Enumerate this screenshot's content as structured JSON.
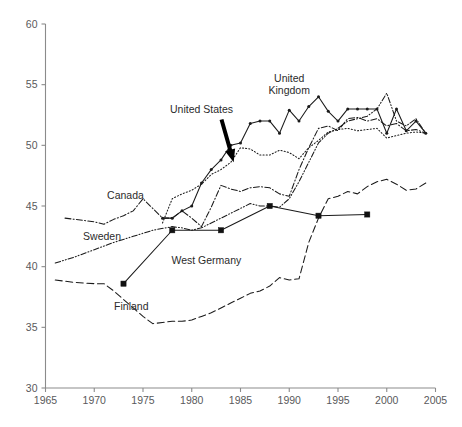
{
  "chart_data": {
    "type": "line",
    "title": "",
    "subtitle": "",
    "xlabel": "",
    "ylabel": "",
    "xlim": [
      1965,
      2005
    ],
    "ylim": [
      30,
      60
    ],
    "xticks": [
      1965,
      1970,
      1975,
      1980,
      1985,
      1990,
      1995,
      2000,
      2005
    ],
    "yticks": [
      30,
      35,
      40,
      45,
      50,
      55,
      60
    ],
    "grid": false,
    "legend_position": "inline-annotations",
    "annotations": [
      {
        "name": "united-states-callout",
        "text": "United States",
        "x": 1981.0,
        "y": 52.7,
        "arrow_to_x": 1984.3,
        "arrow_to_y": 48.6
      },
      {
        "name": "united-kingdom-label",
        "text_line1": "United",
        "text_line2": "Kingdom",
        "x": 1990.0,
        "y": 55.2
      },
      {
        "name": "canada-label",
        "text": "Canada",
        "x": 1973.2,
        "y": 45.6
      },
      {
        "name": "sweden-label",
        "text": "Sweden",
        "x": 1970.8,
        "y": 42.2
      },
      {
        "name": "west-germany-label",
        "text": "West Germany",
        "x": 1981.5,
        "y": 40.2
      },
      {
        "name": "finland-label",
        "text": "Finland",
        "x": 1973.8,
        "y": 36.4
      }
    ],
    "series": [
      {
        "name": "United Kingdom",
        "style": "solid",
        "marker": "dot",
        "color": "#1a1a1a",
        "points": [
          [
            1977,
            44.0
          ],
          [
            1978,
            44.0
          ],
          [
            1979,
            44.6
          ],
          [
            1980,
            45.0
          ],
          [
            1981,
            46.9
          ],
          [
            1982,
            48.0
          ],
          [
            1983,
            48.8
          ],
          [
            1984,
            50.0
          ],
          [
            1985,
            50.2
          ],
          [
            1986,
            51.8
          ],
          [
            1987,
            52.0
          ],
          [
            1988,
            52.0
          ],
          [
            1989,
            51.0
          ],
          [
            1990,
            52.9
          ],
          [
            1991,
            52.0
          ],
          [
            1992,
            53.2
          ],
          [
            1993,
            54.0
          ],
          [
            1994,
            52.8
          ],
          [
            1995,
            52.0
          ],
          [
            1996,
            53.0
          ],
          [
            1997,
            53.0
          ],
          [
            1998,
            53.0
          ],
          [
            1999,
            53.0
          ],
          [
            2000,
            51.0
          ],
          [
            2001,
            53.0
          ],
          [
            2002,
            51.2
          ],
          [
            2003,
            52.0
          ],
          [
            2004,
            51.0
          ]
        ]
      },
      {
        "name": "United States",
        "style": "dotted",
        "marker": "none",
        "color": "#1a1a1a",
        "points": [
          [
            1977,
            43.6
          ],
          [
            1978,
            45.6
          ],
          [
            1979,
            46.0
          ],
          [
            1980,
            46.3
          ],
          [
            1981,
            46.8
          ],
          [
            1982,
            47.6
          ],
          [
            1983,
            48.0
          ],
          [
            1984,
            48.6
          ],
          [
            1985,
            49.8
          ],
          [
            1986,
            49.7
          ],
          [
            1987,
            49.2
          ],
          [
            1988,
            49.2
          ],
          [
            1989,
            49.6
          ],
          [
            1990,
            49.4
          ],
          [
            1991,
            48.9
          ],
          [
            1992,
            49.8
          ],
          [
            1993,
            50.4
          ],
          [
            1994,
            51.1
          ],
          [
            1995,
            51.3
          ],
          [
            1996,
            51.4
          ],
          [
            1997,
            51.2
          ],
          [
            1998,
            51.3
          ],
          [
            1999,
            51.4
          ],
          [
            2000,
            50.6
          ],
          [
            2001,
            50.8
          ],
          [
            2002,
            51.0
          ],
          [
            2003,
            51.1
          ],
          [
            2004,
            51.0
          ]
        ]
      },
      {
        "name": "Canada",
        "style": "dash-dot",
        "marker": "none",
        "color": "#1a1a1a",
        "points": [
          [
            1967,
            44.0
          ],
          [
            1968,
            43.9
          ],
          [
            1969,
            43.8
          ],
          [
            1970,
            43.7
          ],
          [
            1971,
            43.5
          ],
          [
            1972,
            43.9
          ],
          [
            1973,
            44.2
          ],
          [
            1974,
            44.6
          ],
          [
            1975,
            45.6
          ],
          [
            1976,
            44.8
          ],
          [
            1977,
            44.0
          ],
          [
            1978,
            44.0
          ],
          [
            1979,
            44.6
          ],
          [
            1980,
            44.0
          ],
          [
            1981,
            43.3
          ],
          [
            1982,
            44.9
          ],
          [
            1983,
            46.7
          ],
          [
            1984,
            46.4
          ],
          [
            1985,
            46.2
          ],
          [
            1986,
            46.5
          ],
          [
            1987,
            46.6
          ],
          [
            1988,
            46.5
          ],
          [
            1989,
            46.0
          ],
          [
            1990,
            45.8
          ],
          [
            1991,
            48.0
          ],
          [
            1992,
            49.8
          ],
          [
            1993,
            51.4
          ],
          [
            1994,
            51.6
          ],
          [
            1995,
            51.2
          ],
          [
            1996,
            52.2
          ],
          [
            1997,
            52.3
          ],
          [
            1998,
            52.0
          ],
          [
            1999,
            52.2
          ],
          [
            2000,
            51.6
          ],
          [
            2001,
            51.8
          ],
          [
            2002,
            51.2
          ],
          [
            2003,
            51.3
          ],
          [
            2004,
            51.0
          ]
        ]
      },
      {
        "name": "Sweden",
        "style": "dash-dot-dot",
        "marker": "none",
        "color": "#1a1a1a",
        "points": [
          [
            1966,
            40.3
          ],
          [
            1968,
            40.8
          ],
          [
            1970,
            41.4
          ],
          [
            1972,
            42.0
          ],
          [
            1974,
            42.5
          ],
          [
            1976,
            43.0
          ],
          [
            1978,
            43.3
          ],
          [
            1979,
            43.2
          ],
          [
            1980,
            43.0
          ],
          [
            1981,
            43.2
          ],
          [
            1982,
            43.6
          ],
          [
            1983,
            44.0
          ],
          [
            1984,
            44.4
          ],
          [
            1985,
            44.8
          ],
          [
            1986,
            45.2
          ],
          [
            1987,
            45.0
          ],
          [
            1988,
            45.0
          ],
          [
            1989,
            44.9
          ],
          [
            1990,
            45.6
          ],
          [
            1991,
            47.0
          ],
          [
            1992,
            48.6
          ],
          [
            1993,
            50.2
          ],
          [
            1994,
            51.0
          ],
          [
            1995,
            51.4
          ],
          [
            1996,
            52.0
          ],
          [
            1997,
            52.2
          ],
          [
            1998,
            52.4
          ],
          [
            1999,
            53.0
          ],
          [
            2000,
            54.3
          ],
          [
            2001,
            52.0
          ],
          [
            2002,
            51.6
          ],
          [
            2003,
            52.2
          ],
          [
            2004,
            51.0
          ]
        ]
      },
      {
        "name": "Finland",
        "style": "dashed",
        "marker": "none",
        "color": "#1a1a1a",
        "points": [
          [
            1966,
            38.9
          ],
          [
            1968,
            38.7
          ],
          [
            1970,
            38.6
          ],
          [
            1971,
            38.6
          ],
          [
            1972,
            38.0
          ],
          [
            1973,
            37.3
          ],
          [
            1974,
            36.6
          ],
          [
            1975,
            35.9
          ],
          [
            1976,
            35.3
          ],
          [
            1977,
            35.4
          ],
          [
            1978,
            35.5
          ],
          [
            1979,
            35.5
          ],
          [
            1980,
            35.6
          ],
          [
            1981,
            35.9
          ],
          [
            1982,
            36.2
          ],
          [
            1983,
            36.6
          ],
          [
            1984,
            37.0
          ],
          [
            1985,
            37.4
          ],
          [
            1986,
            37.8
          ],
          [
            1987,
            38.0
          ],
          [
            1988,
            38.4
          ],
          [
            1989,
            39.1
          ],
          [
            1990,
            38.9
          ],
          [
            1991,
            39.0
          ],
          [
            1992,
            42.0
          ],
          [
            1993,
            44.0
          ],
          [
            1994,
            45.6
          ],
          [
            1995,
            45.8
          ],
          [
            1996,
            46.2
          ],
          [
            1997,
            46.0
          ],
          [
            1998,
            46.6
          ],
          [
            1999,
            47.0
          ],
          [
            2000,
            47.2
          ],
          [
            2001,
            46.8
          ],
          [
            2002,
            46.3
          ],
          [
            2003,
            46.4
          ],
          [
            2004,
            46.9
          ]
        ]
      },
      {
        "name": "West Germany",
        "style": "solid",
        "marker": "square",
        "color": "#111111",
        "points": [
          [
            1973,
            38.6
          ],
          [
            1978,
            43.0
          ],
          [
            1983,
            43.0
          ],
          [
            1988,
            45.0
          ],
          [
            1993,
            44.2
          ],
          [
            1998,
            44.3
          ]
        ]
      }
    ]
  }
}
